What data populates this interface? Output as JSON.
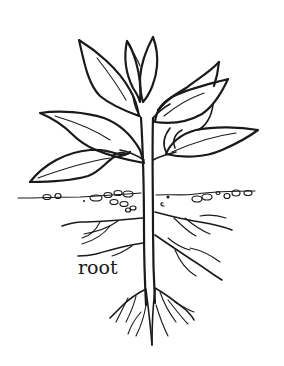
{
  "diagram": {
    "labels": {
      "root": "root"
    },
    "parts": [
      "leaves",
      "stem",
      "soil",
      "roots"
    ],
    "colors": {
      "ink": "#1a1a1a",
      "background": "#ffffff"
    }
  }
}
